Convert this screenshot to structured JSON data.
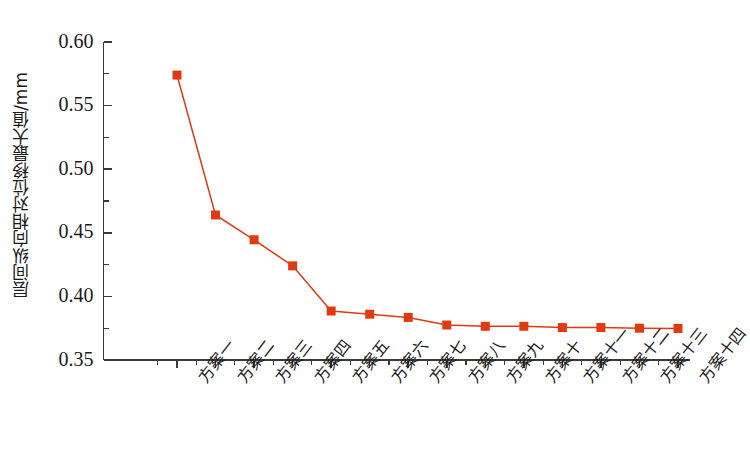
{
  "chart_data": {
    "type": "line",
    "title": "",
    "xlabel": "",
    "ylabel": "层间纵向相对位移最大值/mm",
    "categories": [
      "方案一",
      "方案二",
      "方案三",
      "方案四",
      "方案五",
      "方案六",
      "方案七",
      "方案八",
      "方案九",
      "方案十",
      "方案十一",
      "方案十二",
      "方案十三",
      "方案十四"
    ],
    "values": [
      0.574,
      0.464,
      0.4445,
      0.424,
      0.3885,
      0.386,
      0.3835,
      0.3775,
      0.3765,
      0.3765,
      0.3755,
      0.3755,
      0.375,
      0.3748
    ],
    "series": [
      {
        "name": "层间纵向相对位移最大值",
        "values": [
          0.574,
          0.464,
          0.4445,
          0.424,
          0.3885,
          0.386,
          0.3835,
          0.3775,
          0.3765,
          0.3765,
          0.3755,
          0.3755,
          0.375,
          0.3748
        ]
      }
    ],
    "ylim": [
      0.35,
      0.6
    ],
    "ytick_labels": [
      "0.35",
      "0.40",
      "0.45",
      "0.50",
      "0.55",
      "0.60"
    ],
    "ytick_values": [
      0.35,
      0.4,
      0.45,
      0.5,
      0.55,
      0.6
    ],
    "y_minor_step": 0.025,
    "grid": false,
    "legend": "none",
    "marker": "square",
    "series_color": "#E03A12",
    "axis_color": "#3a3a3a",
    "text_color": "#1a1a1a",
    "background": "#ffffff"
  }
}
